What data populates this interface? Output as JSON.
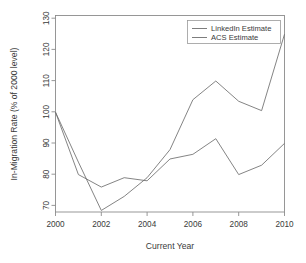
{
  "chart_data": {
    "type": "line",
    "title": "",
    "xlabel": "Current Year",
    "ylabel": "In-Migration Rate (% of 2000 level)",
    "x": [
      2000,
      2001,
      2002,
      2003,
      2004,
      2005,
      2006,
      2007,
      2008,
      2009,
      2010
    ],
    "xlim": [
      2000,
      2010
    ],
    "ylim": [
      68,
      131
    ],
    "xticks": [
      2000,
      2002,
      2004,
      2006,
      2008,
      2010
    ],
    "yticks": [
      70,
      80,
      90,
      100,
      110,
      120,
      130
    ],
    "grid": false,
    "legend_position": "top-right",
    "series": [
      {
        "name": "LinkedIn Estimate",
        "values": [
          100,
          84,
          68.5,
          73,
          79,
          88,
          104,
          110,
          103.5,
          100.5,
          125
        ]
      },
      {
        "name": "ACS Estimate",
        "values": [
          100,
          80,
          76,
          79,
          78,
          85,
          86.5,
          91.5,
          80,
          83,
          90
        ]
      }
    ]
  },
  "axes": {
    "x_tick_labels": [
      "2000",
      "2002",
      "2004",
      "2006",
      "2008",
      "2010"
    ],
    "y_tick_labels": [
      "70",
      "80",
      "90",
      "100",
      "110",
      "120",
      "130"
    ],
    "x_axis_title": "Current Year",
    "y_axis_title": "In-Migration Rate (% of 2000 level)"
  },
  "legend": {
    "entries": [
      {
        "label": "LinkedIn Estimate"
      },
      {
        "label": "ACS Estimate"
      }
    ]
  },
  "colors": {
    "line": "#6e6e6e",
    "frame": "#8c8c8c",
    "text": "#3a3a3a",
    "background": "#ffffff"
  }
}
